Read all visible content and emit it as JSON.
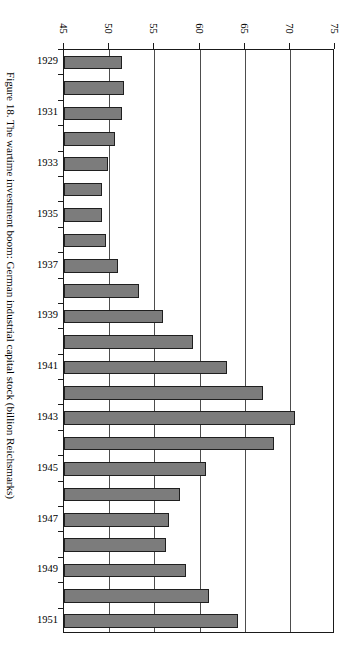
{
  "figure": {
    "caption": "Figure 18. The wartime investment boom: German industrial capital stock (billion Reichsmarks)"
  },
  "chart_data": {
    "type": "bar",
    "orientation": "horizontal",
    "title": "Figure 18. The wartime investment boom: German industrial capital stock (billion Reichsmarks)",
    "xlabel": "",
    "ylabel": "",
    "unit": "billion Reichsmarks",
    "xlim": [
      45,
      75
    ],
    "xticks": [
      45,
      50,
      55,
      60,
      65,
      70,
      75
    ],
    "xtick_labels": [
      "45",
      "50",
      "55",
      "60",
      "65",
      "70",
      "75"
    ],
    "grid": true,
    "grid_axis": "x",
    "legend": false,
    "bar_color": "#7c7c7c",
    "bar_edge_color": "#1f1f1f",
    "axis_color": "#1a1a1a",
    "categories": [
      "1929",
      "1930",
      "1931",
      "1932",
      "1933",
      "1934",
      "1935",
      "1936",
      "1937",
      "1938",
      "1939",
      "1940",
      "1941",
      "1942",
      "1943",
      "1944",
      "1945",
      "1946",
      "1947",
      "1948",
      "1949",
      "1950",
      "1951"
    ],
    "tick_labels_shown": [
      "1929",
      "",
      "1931",
      "",
      "1933",
      "",
      "1935",
      "",
      "1937",
      "",
      "1939",
      "",
      "1941",
      "",
      "1943",
      "",
      "1945",
      "",
      "1947",
      "",
      "1949",
      "",
      "1951"
    ],
    "values": [
      51.4,
      51.6,
      51.4,
      50.7,
      49.9,
      49.2,
      49.2,
      49.6,
      51.0,
      53.3,
      56.0,
      59.3,
      63.0,
      67.0,
      70.6,
      68.3,
      60.7,
      57.8,
      56.6,
      56.3,
      58.5,
      61.1,
      64.3
    ]
  }
}
